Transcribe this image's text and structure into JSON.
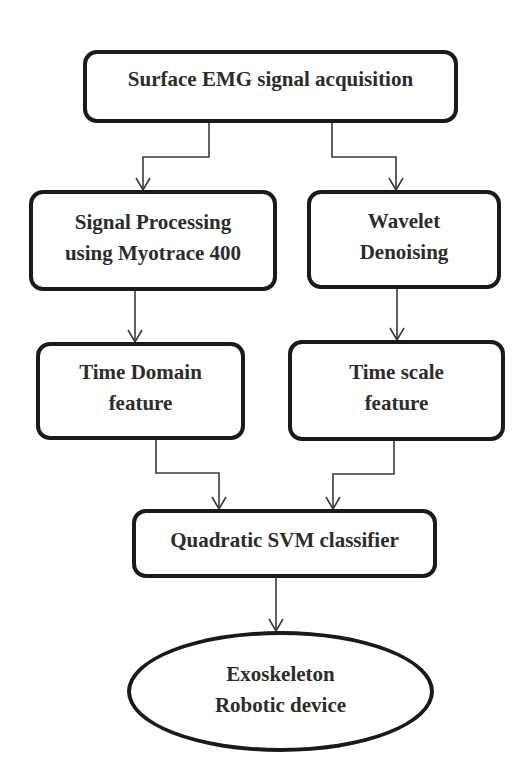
{
  "diagram": {
    "type": "flowchart",
    "nodes": {
      "acquisition": {
        "shape": "rounded-rectangle",
        "lines": [
          "Surface EMG signal acquisition"
        ]
      },
      "signal_processing": {
        "shape": "rounded-rectangle",
        "lines": [
          "Signal Processing",
          "using Myotrace 400"
        ]
      },
      "wavelet_denoising": {
        "shape": "rounded-rectangle",
        "lines": [
          "Wavelet",
          "Denoising"
        ]
      },
      "time_domain": {
        "shape": "rounded-rectangle",
        "lines": [
          "Time Domain",
          "feature"
        ]
      },
      "time_scale": {
        "shape": "rounded-rectangle",
        "lines": [
          "Time scale",
          "feature"
        ]
      },
      "svm": {
        "shape": "rounded-rectangle",
        "lines": [
          "Quadratic SVM classifier"
        ]
      },
      "exoskeleton": {
        "shape": "ellipse",
        "lines": [
          "Exoskeleton",
          "Robotic device"
        ]
      }
    },
    "edges": [
      {
        "from": "acquisition",
        "to": "signal_processing"
      },
      {
        "from": "acquisition",
        "to": "wavelet_denoising"
      },
      {
        "from": "signal_processing",
        "to": "time_domain"
      },
      {
        "from": "wavelet_denoising",
        "to": "time_scale"
      },
      {
        "from": "time_domain",
        "to": "svm"
      },
      {
        "from": "time_scale",
        "to": "svm"
      },
      {
        "from": "svm",
        "to": "exoskeleton"
      }
    ],
    "colors": {
      "border": "#1a1a1a",
      "arrow": "#3a3a3a",
      "text": "#2c2c2c",
      "background": "#ffffff"
    }
  }
}
